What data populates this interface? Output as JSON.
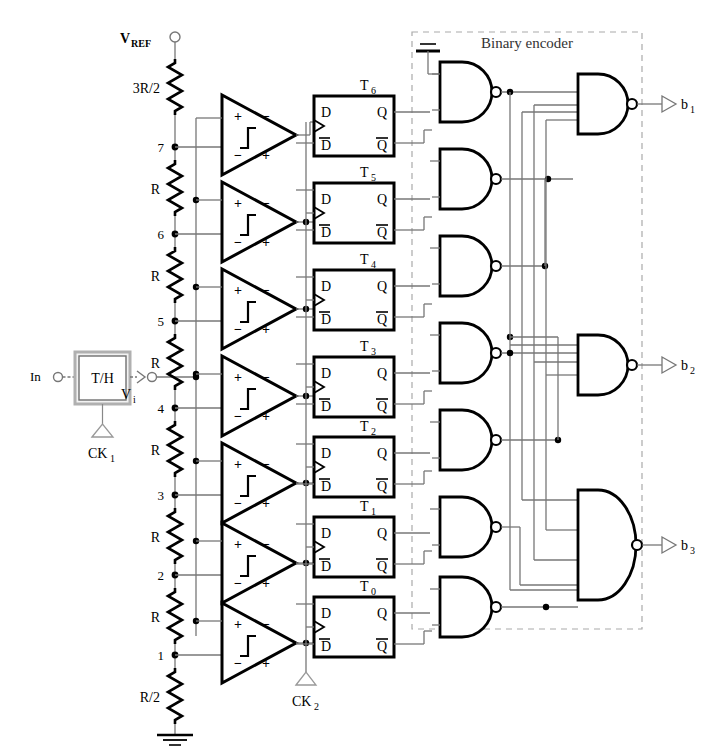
{
  "diagram": {
    "encoder_box_label": "Binary encoder"
  },
  "input": {
    "in_label": "In",
    "th_label": "T/H",
    "ck1_label": "CK",
    "ck1_sub": "1",
    "vi_label": "V",
    "vi_sub": "i"
  },
  "clock2": {
    "label": "CK",
    "sub": "2"
  },
  "ladder": {
    "vref_label": "V",
    "vref_sub": "REF",
    "resistors": [
      {
        "label": "3R/2"
      },
      {
        "label": "R"
      },
      {
        "label": "R"
      },
      {
        "label": "R"
      },
      {
        "label": "R"
      },
      {
        "label": "R"
      },
      {
        "label": "R"
      },
      {
        "label": "R/2"
      }
    ],
    "taps": [
      "7",
      "6",
      "5",
      "4",
      "3",
      "2",
      "1"
    ]
  },
  "comparators": {
    "count": 7,
    "plus": "+",
    "minus": "−"
  },
  "flipflops": {
    "count": 7,
    "d_label": "D",
    "dbar_label": "D",
    "q_label": "Q",
    "qbar_label": "Q",
    "thermo_labels": [
      "T",
      "T",
      "T",
      "T",
      "T",
      "T",
      "T"
    ],
    "thermo_subs": [
      "6",
      "5",
      "4",
      "3",
      "2",
      "1",
      "0"
    ]
  },
  "outputs": [
    {
      "label": "b",
      "sub": "1"
    },
    {
      "label": "b",
      "sub": "2"
    },
    {
      "label": "b",
      "sub": "3"
    }
  ],
  "colors": {
    "wire": "#777777",
    "ink": "#000000",
    "dashed": "#aaaaaa",
    "th_fill": "#f2f2f2",
    "th_border": "#b0b0b0"
  }
}
